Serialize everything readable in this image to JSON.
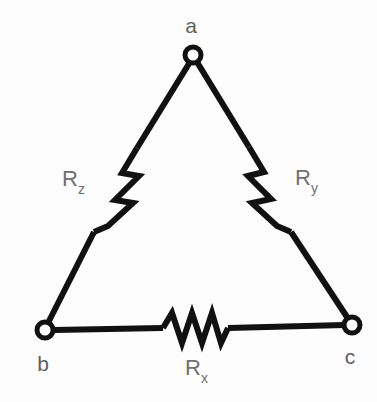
{
  "figure": {
    "background_color": "#fdfdfd",
    "line_color": "#111111",
    "label_color": "#707070"
  },
  "nodes": [
    {
      "id": "a",
      "label": "a",
      "x": 193,
      "y": 55,
      "label_x": 191,
      "label_y": 33
    },
    {
      "id": "b",
      "label": "b",
      "x": 45,
      "y": 330,
      "label_x": 43,
      "label_y": 371
    },
    {
      "id": "c",
      "label": "c",
      "x": 352,
      "y": 325,
      "label_x": 350,
      "label_y": 364
    }
  ],
  "resistors": [
    {
      "id": "Rx",
      "label_main": "R",
      "label_sub": "x",
      "between": "b-c",
      "label_x": 193,
      "label_y": 375
    },
    {
      "id": "Ry",
      "label_main": "R",
      "label_sub": "y",
      "between": "a-c",
      "label_x": 303,
      "label_y": 185
    },
    {
      "id": "Rz",
      "label_main": "R",
      "label_sub": "z",
      "between": "a-b",
      "label_x": 70,
      "label_y": 186
    }
  ],
  "geometry": {
    "wire_ab_top": "M 190 62 L 137 148",
    "zigzag_ab": "M 137 148 L 122 173 L 139 176 L 115 200 L 133 203 L 108 226 L 94 232",
    "wire_ab_bottom": "M 94 232 L 49 321",
    "wire_ac_top": "M 197 62 L 249 147",
    "zigzag_ac": "M 249 147 L 264 172 L 248 176 L 271 199 L 252 203 L 277 226 L 291 232",
    "wire_ac_bottom": "M 291 232 L 347 317",
    "wire_bc_left": "M 54 330 L 163 328",
    "zigzag_bc": "M 163 328 L 172 313 L 182 343 L 192 313 L 202 343 L 212 313 L 221 343 L 228 328",
    "wire_bc_right": "M 228 328 L 344 325"
  }
}
